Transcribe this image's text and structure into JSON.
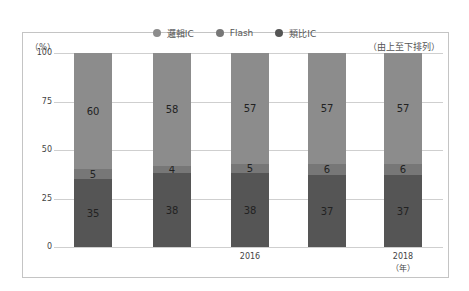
{
  "chart_data": {
    "type": "bar",
    "stacked": true,
    "percent": true,
    "title": "",
    "categories": [
      "",
      "",
      "2016",
      "",
      "2018"
    ],
    "series": [
      {
        "name": "類比IC",
        "values": [
          35,
          38,
          38,
          37,
          37
        ],
        "color": "#555555"
      },
      {
        "name": "Flash",
        "values": [
          5,
          4,
          5,
          6,
          6
        ],
        "color": "#777777"
      },
      {
        "name": "邏輯IC",
        "values": [
          60,
          58,
          57,
          57,
          57
        ],
        "color": "#8c8c8c"
      }
    ],
    "xlabel": "（年）",
    "ylabel": "（%）",
    "ylim": [
      0,
      100
    ],
    "yticks": [
      0,
      25,
      50,
      75,
      100
    ],
    "grid": true,
    "legend_position": "top",
    "annotation": "（由上至下排列）"
  },
  "legend": [
    {
      "label": "邏輯IC",
      "color": "#8c8c8c"
    },
    {
      "label": "Flash",
      "color": "#777777"
    },
    {
      "label": "類比IC",
      "color": "#555555"
    }
  ],
  "axis": {
    "y_unit": "（%）",
    "x_unit": "（年）",
    "order_note": "（由上至下排列）",
    "yticks": [
      "100",
      "75",
      "50",
      "25",
      "0"
    ],
    "xticks": [
      {
        "label": "2016",
        "index": 2
      },
      {
        "label": "2018",
        "index": 4
      }
    ]
  }
}
